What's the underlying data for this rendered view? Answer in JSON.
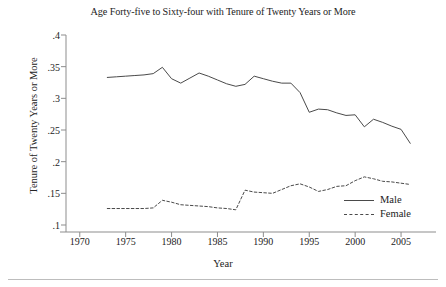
{
  "chart_data": {
    "type": "line",
    "title": "Age Forty-five to Sixty-four with Tenure of Twenty Years or More",
    "xlabel": "Year",
    "ylabel": "Tenure of Twenty Years or More",
    "xlim": [
      1968.5,
      2007.5
    ],
    "ylim": [
      0.1,
      0.4
    ],
    "xticks": [
      1970,
      1975,
      1980,
      1985,
      1990,
      1995,
      2000,
      2005
    ],
    "xtick_labels": [
      "1970",
      "1975",
      "1980",
      "1985",
      "1990",
      "1995",
      "2000",
      "2005"
    ],
    "yticks": [
      0.1,
      0.15,
      0.2,
      0.25,
      0.3,
      0.35,
      0.4
    ],
    "ytick_labels": [
      ".1",
      ".15",
      ".2",
      ".25",
      ".3",
      ".35",
      ".4"
    ],
    "grid": false,
    "legend_position": "lower right",
    "x": [
      1973,
      1974,
      1975,
      1976,
      1977,
      1978,
      1979,
      1980,
      1981,
      1982,
      1983,
      1984,
      1985,
      1986,
      1987,
      1988,
      1989,
      1990,
      1991,
      1992,
      1993,
      1994,
      1995,
      1996,
      1997,
      1998,
      1999,
      2000,
      2001,
      2002,
      2003,
      2004,
      2005,
      2006
    ],
    "series": [
      {
        "name": "Male",
        "style": "solid",
        "color": "#4a4a4a",
        "values": [
          0.333,
          0.334,
          0.335,
          0.336,
          0.337,
          0.339,
          0.349,
          0.331,
          0.324,
          0.332,
          0.34,
          0.335,
          0.329,
          0.323,
          0.319,
          0.322,
          0.335,
          0.331,
          0.327,
          0.324,
          0.324,
          0.309,
          0.278,
          0.283,
          0.282,
          0.277,
          0.273,
          0.274,
          0.255,
          0.267,
          0.262,
          0.256,
          0.251,
          0.229
        ]
      },
      {
        "name": "Female",
        "style": "dashed",
        "color": "#4a4a4a",
        "values": [
          0.126,
          0.126,
          0.126,
          0.126,
          0.126,
          0.127,
          0.139,
          0.136,
          0.132,
          0.131,
          0.13,
          0.129,
          0.127,
          0.126,
          0.124,
          0.155,
          0.152,
          0.151,
          0.15,
          0.156,
          0.162,
          0.165,
          0.16,
          0.153,
          0.156,
          0.161,
          0.162,
          0.17,
          0.176,
          0.173,
          0.169,
          0.168,
          0.166,
          0.164
        ]
      }
    ]
  },
  "legend": {
    "entries": [
      {
        "label": "Male"
      },
      {
        "label": "Female"
      }
    ]
  }
}
